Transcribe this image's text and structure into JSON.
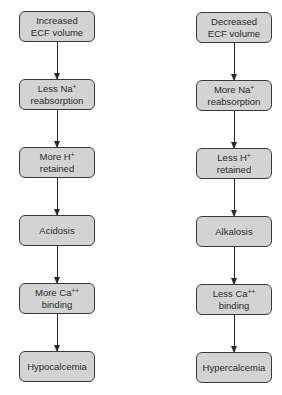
{
  "left_chain": [
    {
      "line1": "Increased",
      "line2": "ECF volume",
      "sup": ""
    },
    {
      "line1": "Less Na",
      "sup": "+",
      "line2": "reabsorption"
    },
    {
      "line1": "More H",
      "sup": "+",
      "line2": "retained"
    },
    {
      "line1": "Acidosis",
      "sup": "",
      "line2": ""
    },
    {
      "line1": "More Ca",
      "sup": "++",
      "line2": "binding"
    },
    {
      "line1": "Hypocalcemia",
      "sup": "",
      "line2": ""
    }
  ],
  "right_chain": [
    {
      "line1": "Decreased",
      "line2": "ECF volume",
      "sup": ""
    },
    {
      "line1": "More Na",
      "sup": "+",
      "line2": "reabsorption"
    },
    {
      "line1": "Less H",
      "sup": "+",
      "line2": "retained"
    },
    {
      "line1": "Alkalosis",
      "sup": "",
      "line2": ""
    },
    {
      "line1": "Less Ca",
      "sup": "++",
      "line2": "binding"
    },
    {
      "line1": "Hypercalcemia",
      "sup": "",
      "line2": ""
    }
  ],
  "colors": {
    "box_fill": "#d3d3d3",
    "box_border": "#3a3a3a",
    "arrow": "#2a2a2a"
  }
}
